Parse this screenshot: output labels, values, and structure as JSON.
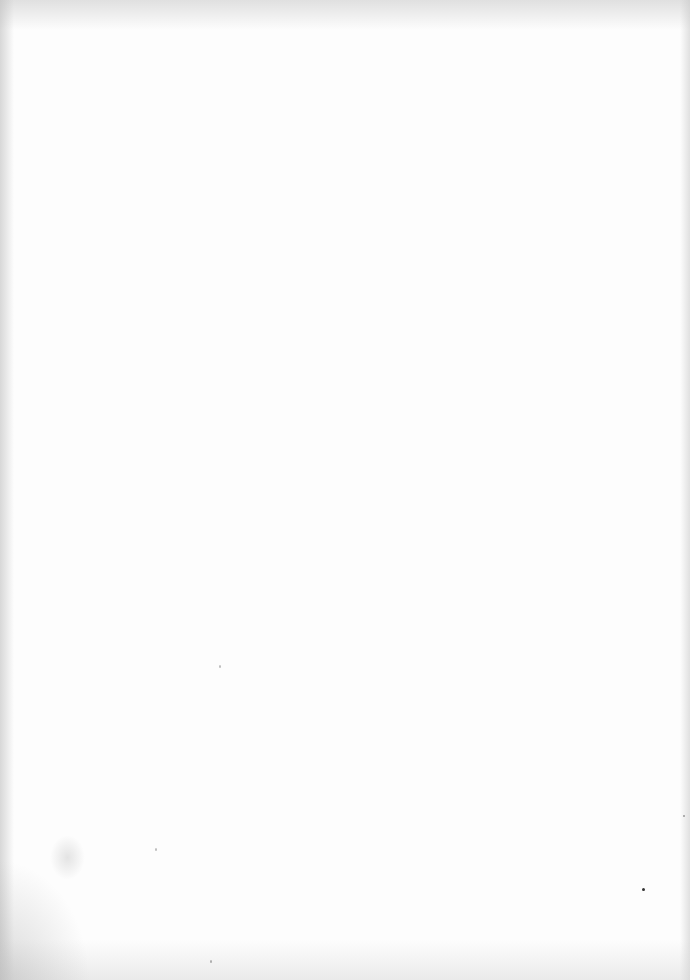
{
  "page": {
    "type": "blank-scanned-page",
    "text": "",
    "background_color": "#fdfdfd",
    "edge_shadow_color": "#c8c8c8"
  }
}
